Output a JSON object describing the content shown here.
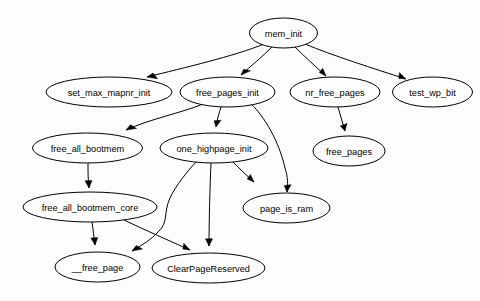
{
  "diagram": {
    "type": "directed-graph",
    "background_color": "#fdfdfd",
    "node_fill_color": "#ffffff",
    "node_stroke_color": "#000000",
    "edge_color": "#000000",
    "nodes": [
      {
        "id": "mem_init",
        "label": "mem_init",
        "cx": 283.5,
        "cy": 33,
        "rx": 34,
        "ry": 15
      },
      {
        "id": "set_max_mapnr_init",
        "label": "set_max_mapnr_init",
        "cx": 109,
        "cy": 92,
        "rx": 63,
        "ry": 15
      },
      {
        "id": "free_pages_init",
        "label": "free_pages_init",
        "cx": 227.5,
        "cy": 92,
        "rx": 47.5,
        "ry": 15
      },
      {
        "id": "nr_free_pages",
        "label": "nr_free_pages",
        "cx": 335,
        "cy": 92,
        "rx": 45,
        "ry": 15
      },
      {
        "id": "test_wp_bit",
        "label": "test_wp_bit",
        "cx": 432.5,
        "cy": 92,
        "rx": 40,
        "ry": 15
      },
      {
        "id": "free_all_bootmem",
        "label": "free_all_bootmem",
        "cx": 87.5,
        "cy": 148,
        "rx": 55,
        "ry": 15
      },
      {
        "id": "one_highpage_init",
        "label": "one_highpage_init",
        "cx": 214,
        "cy": 148,
        "rx": 54,
        "ry": 15
      },
      {
        "id": "free_pages",
        "label": "free_pages",
        "cx": 349,
        "cy": 151,
        "rx": 36,
        "ry": 15
      },
      {
        "id": "free_all_bootmem_core",
        "label": "free_all_bootmem_core",
        "cx": 90,
        "cy": 207,
        "rx": 67,
        "ry": 15
      },
      {
        "id": "page_is_ram",
        "label": "page_is_ram",
        "cx": 286.5,
        "cy": 208,
        "rx": 43.5,
        "ry": 15
      },
      {
        "id": "__free_page",
        "label": "__free_page",
        "cx": 97.5,
        "cy": 267,
        "rx": 42.5,
        "ry": 15
      },
      {
        "id": "ClearPageReserved",
        "label": "ClearPageReserved",
        "cx": 208.5,
        "cy": 268,
        "rx": 56.5,
        "ry": 15
      }
    ],
    "edges": [
      {
        "from": "mem_init",
        "to": "set_max_mapnr_init",
        "path": "M 264,44 C 235,56 183,68 147,77",
        "arrow": "M 147,77 L 157.6,78.7 L 153.0,73.0 Z"
      },
      {
        "from": "mem_init",
        "to": "free_pages_init",
        "path": "M 272,47 C 263,56 251,66 241,75",
        "arrow": "M 241,75 L 250.4,70.8 L 243.6,69.3 Z"
      },
      {
        "from": "mem_init",
        "to": "nr_free_pages",
        "path": "M 295,47 C 304,56 316,67 326,76",
        "arrow": "M 326,76 L 322.7,68.2 L 319.3,72.5 Z"
      },
      {
        "from": "mem_init",
        "to": "test_wp_bit",
        "path": "M 305,44 C 331,55 375,69 406,79",
        "arrow": "M 406,79 L 399.4,72.6 L 398.8,78.4 Z"
      },
      {
        "from": "free_pages_init",
        "to": "free_all_bootmem",
        "path": "M 203,104 C 181,113 150,119 126,130",
        "arrow": "M 126,130 L 136.5,128.4 L 130.5,124.7 Z"
      },
      {
        "from": "free_pages_init",
        "to": "one_highpage_init",
        "path": "M 221,107 C 219,113 217,120 216,127",
        "arrow": "M 216,127 L 221.0,120.3 L 214.0,120.8 Z"
      },
      {
        "from": "free_pages_init",
        "to": "page_is_ram",
        "path": "M 251,104 C 264,116 279,141 285,168 C 288,177 288,184 287,192",
        "arrow": "M 287,192 L 291.1,184.7 L 284.2,185.5 Z"
      },
      {
        "from": "one_highpage_init",
        "to": "page_is_ram",
        "path": "M 233,162 C 239,168 246,175 254,182",
        "arrow": "M 254,182 L 250.4,174.6 L 247.2,179.0 Z"
      },
      {
        "from": "one_highpage_init",
        "to": "__free_page",
        "path": "M 196,162 C 187,172 176,185 170,198 C 163,213 169,222 158,232 C 151,240 142,245 132,251",
        "arrow": "M 132,251 L 142.4,249.0 L 136.2,245.5 Z"
      },
      {
        "from": "one_highpage_init",
        "to": "ClearPageReserved",
        "path": "M 211,163 C 210,184 209,222 209,246",
        "arrow": "M 209,246 L 212.5,238.8 L 205.5,238.8 Z"
      },
      {
        "from": "nr_free_pages",
        "to": "free_pages",
        "path": "M 338,107 C 340,115 343,123 345,131",
        "arrow": "M 345,131 L 347.0,123.4 L 340.3,126.0 Z"
      },
      {
        "from": "free_all_bootmem",
        "to": "free_all_bootmem_core",
        "path": "M 88,163 C 88,171 88,180 89,188",
        "arrow": "M 89,188 L 92.0,180.6 L 85.0,180.8 Z"
      },
      {
        "from": "free_all_bootmem_core",
        "to": "__free_page",
        "path": "M 92,222 C 93,229 94,237 95,245",
        "arrow": "M 95,245 L 97.8,237.6 L 90.8,238.0 Z"
      },
      {
        "from": "free_all_bootmem_core",
        "to": "ClearPageReserved",
        "path": "M 124,220 C 145,230 170,241 190,250",
        "arrow": "M 190,250 L 183.8,243.3 L 182.9,249.0 Z"
      }
    ]
  }
}
